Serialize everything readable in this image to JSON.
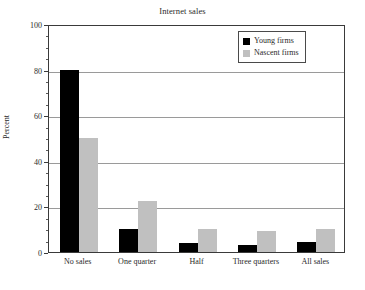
{
  "chart_data": {
    "type": "bar",
    "title": "Internet sales",
    "xlabel": "",
    "ylabel": "Percent",
    "ylim": [
      0,
      100
    ],
    "yticks": [
      0,
      20,
      40,
      60,
      80,
      100
    ],
    "ytick_labels": [
      "0",
      "20",
      "40",
      "60",
      "80",
      "100"
    ],
    "grid": true,
    "legend_position": "top-right",
    "categories": [
      "No sales",
      "One quarter",
      "Half",
      "Three quarters",
      "All sales"
    ],
    "series": [
      {
        "name": "Young firms",
        "color": "#000000",
        "values": [
          80,
          10,
          4,
          3,
          4.5
        ]
      },
      {
        "name": "Nascent firms",
        "color": "#c0c0c0",
        "values": [
          50,
          22.5,
          10,
          9,
          10
        ]
      }
    ]
  },
  "colors": {
    "young_firms": "#000000",
    "nascent_firms": "#c0c0c0",
    "axis": "#3a3a3a",
    "gridline": "#9a9a9a",
    "background": "#ffffff"
  }
}
